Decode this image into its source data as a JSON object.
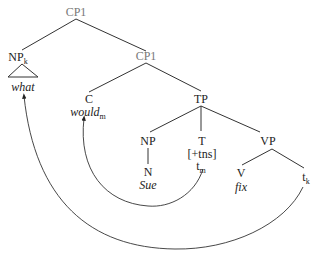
{
  "tree": {
    "root": {
      "label": "CP1"
    },
    "np_k": {
      "label": "NP",
      "index": "k",
      "word": "what"
    },
    "cp1_inner": {
      "label": "CP1"
    },
    "c": {
      "label": "C",
      "word": "would",
      "index": "m"
    },
    "tp": {
      "label": "TP"
    },
    "np": {
      "label": "NP"
    },
    "n": {
      "label": "N",
      "word": "Sue"
    },
    "t": {
      "label": "T",
      "feature": "[+tns]",
      "trace": "t",
      "trace_index": "m"
    },
    "vp": {
      "label": "VP"
    },
    "v": {
      "label": "V",
      "word": "fix"
    },
    "t_k": {
      "trace": "t",
      "trace_index": "k"
    }
  },
  "movements": [
    {
      "from": "t_m",
      "to": "would_m"
    },
    {
      "from": "t_k",
      "to": "what"
    }
  ],
  "colors": {
    "line": "#333333",
    "category_gray": "#777777",
    "text": "#222222"
  }
}
